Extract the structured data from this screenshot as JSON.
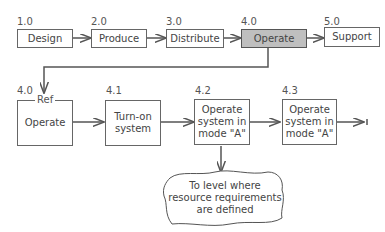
{
  "top_row": [
    {
      "id": "1.0",
      "label": "Design"
    },
    {
      "id": "2.0",
      "label": "Produce"
    },
    {
      "id": "3.0",
      "label": "Distribute"
    },
    {
      "id": "4.0",
      "label": "Operate",
      "highlighted": true
    },
    {
      "id": "5.0",
      "label": "Support"
    }
  ],
  "bottom_row": [
    {
      "id": "4.0",
      "ref": "Ref",
      "label": "Operate"
    },
    {
      "id": "4.1",
      "label": "Turn-on system"
    },
    {
      "id": "4.2",
      "label": "Operate system in mode \"A\""
    },
    {
      "id": "4.3",
      "label": "Operate system in mode \"A\""
    }
  ],
  "cloud": {
    "label": "To level where resource requirements are defined"
  },
  "colors": {
    "highlight": "#bfbfbf",
    "line": "#555555"
  }
}
